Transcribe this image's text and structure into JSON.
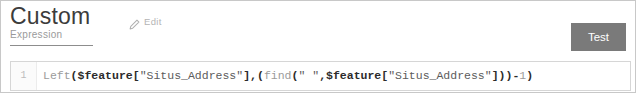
{
  "panel": {
    "title": "Custom",
    "subtitle": "Expression"
  },
  "edit": {
    "label": "Edit",
    "icon": "pencil-icon"
  },
  "actions": {
    "test_label": "Test"
  },
  "editor": {
    "line_number": "1",
    "expression": "Left($feature[\"Situs_Address\"],(find(\" \",$feature[\"Situs_Address\"]))-1)",
    "tokens": [
      {
        "t": "Left",
        "c": "tok-fn"
      },
      {
        "t": "(",
        "c": "tok-punct"
      },
      {
        "t": "$feature",
        "c": "tok-var"
      },
      {
        "t": "[",
        "c": "tok-punct"
      },
      {
        "t": "\"Situs_Address\"",
        "c": "tok-string"
      },
      {
        "t": "]",
        "c": "tok-punct"
      },
      {
        "t": ",",
        "c": "tok-punct"
      },
      {
        "t": "(",
        "c": "tok-punct"
      },
      {
        "t": "find",
        "c": "tok-fn"
      },
      {
        "t": "(",
        "c": "tok-punct"
      },
      {
        "t": "\" \"",
        "c": "tok-string"
      },
      {
        "t": ",",
        "c": "tok-punct"
      },
      {
        "t": "$feature",
        "c": "tok-var"
      },
      {
        "t": "[",
        "c": "tok-punct"
      },
      {
        "t": "\"Situs_Address\"",
        "c": "tok-string"
      },
      {
        "t": "]",
        "c": "tok-punct"
      },
      {
        "t": ")",
        "c": "tok-punct"
      },
      {
        "t": ")",
        "c": "tok-punct"
      },
      {
        "t": "-",
        "c": "tok-op"
      },
      {
        "t": "1",
        "c": "tok-num"
      },
      {
        "t": ")",
        "c": "tok-punct"
      }
    ]
  },
  "colors": {
    "button_bg": "#7a7a7a",
    "title_text": "#3c3c3c",
    "muted_text": "#9a9a9a",
    "panel_border": "#c8c8c8"
  }
}
